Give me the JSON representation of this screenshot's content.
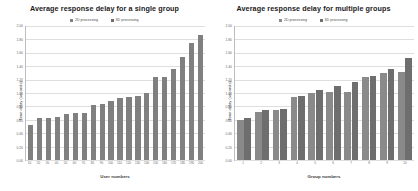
{
  "charts": [
    {
      "title": "Average response delay for a single group",
      "legend": [
        {
          "label": "2D processing",
          "color": "#808080"
        },
        {
          "label": "3D processing",
          "color": "#6e6e6e"
        }
      ],
      "ylabel": "Time delay (seconds)",
      "xlabel": "User numbers",
      "yticks": [
        "2.00",
        "1.80",
        "1.60",
        "1.40",
        "1.20",
        "1.00",
        "0.80",
        "0.60",
        "0.40",
        "0.20",
        "0.00"
      ],
      "chart_data": {
        "type": "bar",
        "title": "Average response delay for a single group",
        "xlabel": "User numbers",
        "ylabel": "Time delay (seconds)",
        "ylim": [
          0,
          2.0
        ],
        "grid": true,
        "legend_position": "top-center",
        "categories": [
          "10",
          "20",
          "30",
          "40",
          "50",
          "60",
          "70",
          "80",
          "90",
          "100",
          "110",
          "120",
          "130",
          "140",
          "150",
          "160",
          "170",
          "180",
          "190",
          "200"
        ],
        "series": [
          {
            "name": "2D processing",
            "color": "#808080",
            "values": [
              0.52,
              0.62,
              0.62,
              0.64,
              0.68,
              0.7,
              0.7,
              0.82,
              0.84,
              0.88,
              0.92,
              0.94,
              0.95,
              1.0,
              1.24,
              1.24,
              1.36,
              1.54,
              1.74,
              1.86
            ]
          }
        ]
      }
    },
    {
      "title": "Average response delay for multiple groups",
      "legend": [
        {
          "label": "2D processing",
          "color": "#8a8a8a"
        },
        {
          "label": "3D processing",
          "color": "#6e6e6e"
        }
      ],
      "ylabel": "Time delay (seconds)",
      "xlabel": "Group numbers",
      "yticks": [
        "2.00",
        "1.80",
        "1.60",
        "1.40",
        "1.20",
        "1.00",
        "0.80",
        "0.60",
        "0.40",
        "0.20",
        "0.00"
      ],
      "chart_data": {
        "type": "bar",
        "title": "Average response delay for multiple groups",
        "xlabel": "Group numbers",
        "ylabel": "Time delay (seconds)",
        "ylim": [
          0,
          2.0
        ],
        "grid": true,
        "legend_position": "top-center",
        "categories": [
          "1",
          "2",
          "3",
          "4",
          "5",
          "6",
          "7",
          "8",
          "9",
          "10"
        ],
        "series": [
          {
            "name": "2D processing",
            "color": "#8a8a8a",
            "values": [
              0.6,
              0.72,
              0.74,
              0.94,
              1.0,
              1.02,
              1.02,
              1.24,
              1.3,
              1.32
            ]
          },
          {
            "name": "3D processing",
            "color": "#6e6e6e",
            "values": [
              0.62,
              0.74,
              0.76,
              0.96,
              1.04,
              1.1,
              1.16,
              1.26,
              1.36,
              1.52
            ]
          }
        ]
      }
    }
  ]
}
